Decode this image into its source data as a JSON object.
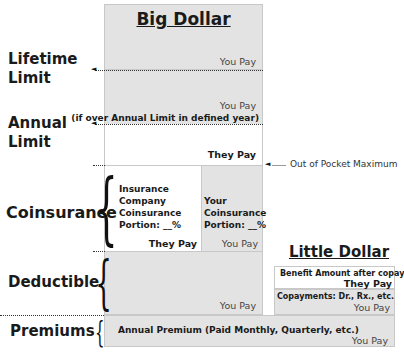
{
  "big_dollar": {
    "title": "Big Dollar",
    "lifetime_section": {
      "pay_label": "You Pay"
    },
    "annual_section": {
      "pay_label": "You Pay",
      "note": "(if over Annual Limit in defined year)"
    },
    "oop_section": {
      "pay_label": "They Pay"
    },
    "coinsurance": {
      "left": {
        "lines": [
          "Insurance",
          "Company",
          "Coinsurance",
          "Portion: __%"
        ],
        "pay_label": "They Pay"
      },
      "right": {
        "lines": [
          "Your",
          "Coinsurance",
          "Portion: __%"
        ],
        "pay_label": "You Pay"
      }
    },
    "deductible_section": {
      "pay_label": "You Pay"
    }
  },
  "side_labels": {
    "lifetime_limit": [
      "Lifetime",
      "Limit"
    ],
    "annual_limit": [
      "Annual",
      "Limit"
    ],
    "coinsurance": "Coinsurance",
    "deductible": "Deductible",
    "premiums": "Premiums"
  },
  "out_of_pocket_label": "Out of Pocket Maximum",
  "little_dollar": {
    "title": "Little Dollar",
    "benefit": {
      "label": "Benefit Amount after copay",
      "pay_label": "They Pay"
    },
    "copay": {
      "label": "Copayments: Dr., Rx., etc.",
      "pay_label": "You Pay"
    }
  },
  "premiums": {
    "label": "Annual Premium (Paid Monthly, Quarterly, etc.)",
    "pay_label": "You Pay"
  },
  "colors": {
    "gray_fill": "#e3e3e3",
    "white_fill": "#ffffff",
    "text": "#1a1a1a"
  }
}
